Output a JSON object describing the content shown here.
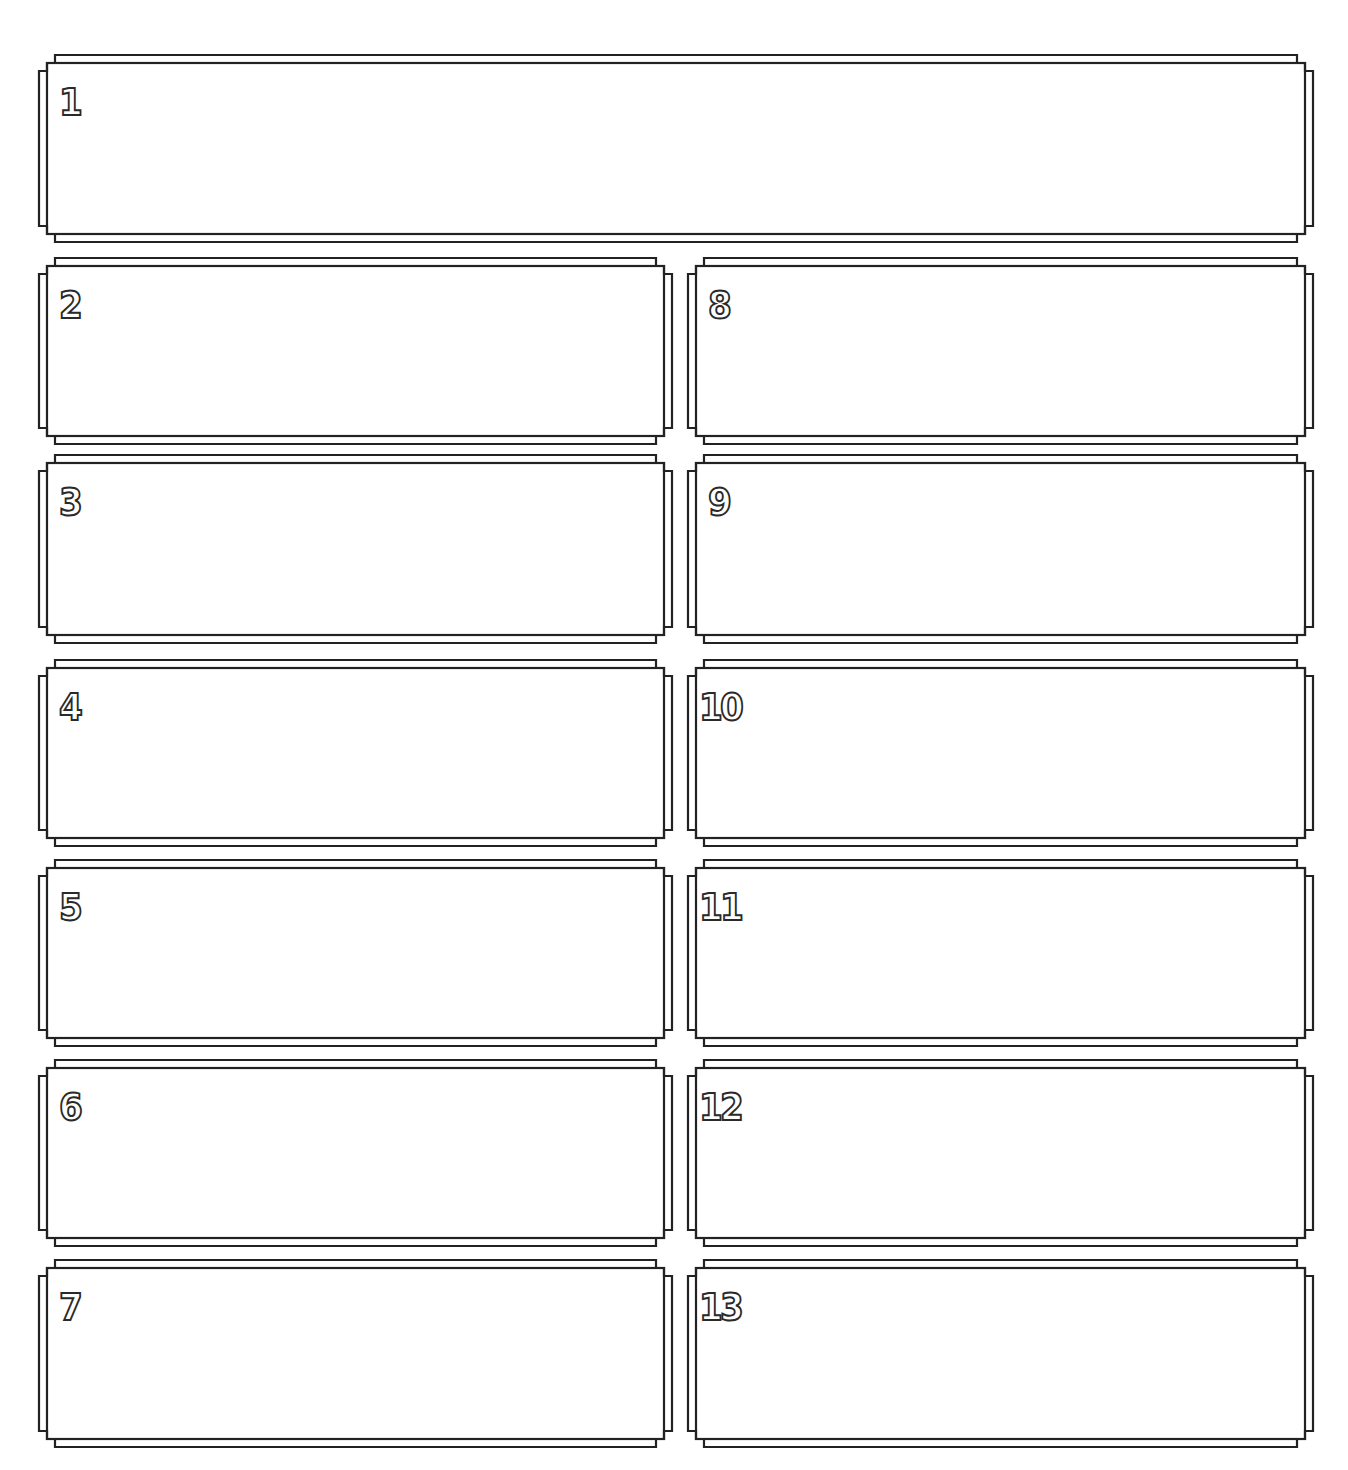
{
  "page": {
    "background": "#ffffff",
    "line_color": "#222222"
  },
  "frames": [
    {
      "label": "1",
      "x": 39,
      "y": 55,
      "w": 1274,
      "h": 187
    },
    {
      "label": "2",
      "x": 39,
      "y": 258,
      "w": 633,
      "h": 186
    },
    {
      "label": "3",
      "x": 39,
      "y": 455,
      "w": 633,
      "h": 188
    },
    {
      "label": "4",
      "x": 39,
      "y": 660,
      "w": 633,
      "h": 186
    },
    {
      "label": "5",
      "x": 39,
      "y": 860,
      "w": 633,
      "h": 186
    },
    {
      "label": "6",
      "x": 39,
      "y": 1060,
      "w": 633,
      "h": 186
    },
    {
      "label": "7",
      "x": 39,
      "y": 1260,
      "w": 633,
      "h": 187
    },
    {
      "label": "8",
      "x": 688,
      "y": 258,
      "w": 625,
      "h": 186
    },
    {
      "label": "9",
      "x": 688,
      "y": 455,
      "w": 625,
      "h": 188
    },
    {
      "label": "10",
      "x": 688,
      "y": 660,
      "w": 625,
      "h": 186
    },
    {
      "label": "11",
      "x": 688,
      "y": 860,
      "w": 625,
      "h": 186
    },
    {
      "label": "12",
      "x": 688,
      "y": 1060,
      "w": 625,
      "h": 186
    },
    {
      "label": "13",
      "x": 688,
      "y": 1260,
      "w": 625,
      "h": 187
    }
  ]
}
